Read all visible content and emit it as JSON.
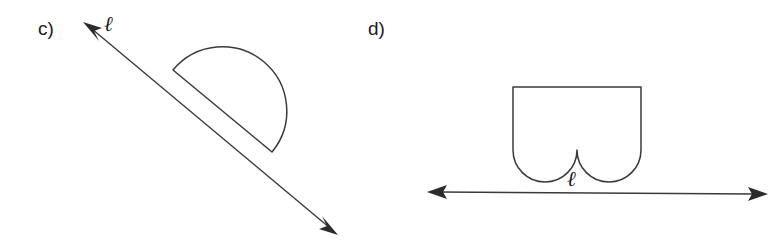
{
  "figure": {
    "background_color": "#ffffff",
    "stroke_color": "#3a3a3a",
    "arrow_color": "#2b2b2b",
    "text_color": "#1a1a1a",
    "panels": [
      {
        "id": "c",
        "label": "c)",
        "line_label": "ℓ",
        "description": "Semicircular half-disk above a diagonal line ℓ running from upper-left to lower-right, arrowheads at both ends",
        "line": {
          "start": {
            "x": 83,
            "y": 22
          },
          "end": {
            "x": 338,
            "y": 235
          },
          "double_headed": true
        },
        "shape": {
          "type": "semicircle",
          "diameter_start": {
            "x": 173,
            "y": 70
          },
          "diameter_end": {
            "x": 272,
            "y": 152
          },
          "radius": 64,
          "bulge": "up-right"
        },
        "label_position": {
          "x": 38,
          "y": 35
        },
        "line_label_position": {
          "x": 104,
          "y": 30
        }
      },
      {
        "id": "d",
        "label": "d)",
        "line_label": "ℓ",
        "description": "Rectangle with two semicircular notches cut out of its bottom edge, sitting above a horizontal line ℓ with arrowheads at both ends",
        "line": {
          "start": {
            "x": 427,
            "y": 192
          },
          "end": {
            "x": 768,
            "y": 194
          },
          "double_headed": true
        },
        "shape": {
          "type": "rectangle-with-two-semicircular-notches",
          "left": 513,
          "top": 87,
          "right": 641,
          "bottom": 150,
          "notch_count": 2,
          "notch_radius": 32
        },
        "label_position": {
          "x": 368,
          "y": 35
        },
        "line_label_position": {
          "x": 567,
          "y": 186
        }
      }
    ]
  }
}
